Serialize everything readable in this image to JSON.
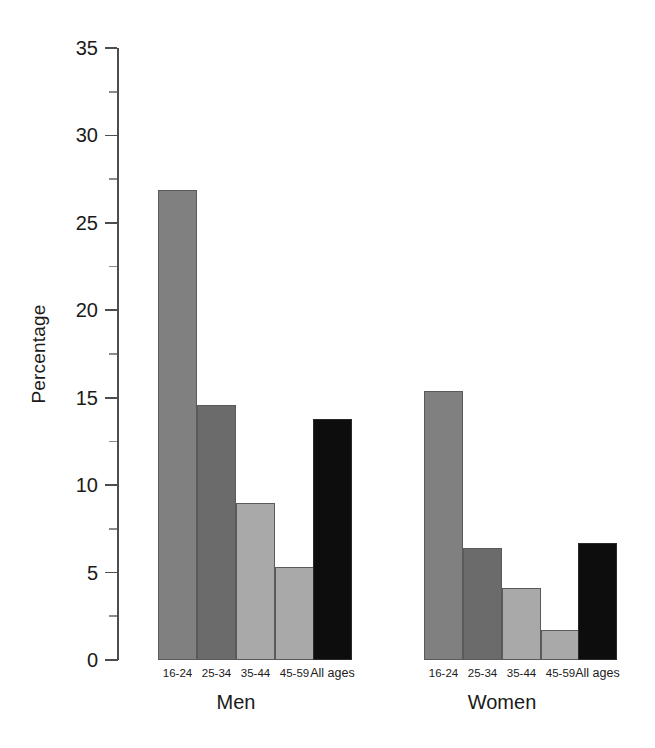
{
  "chart_data": {
    "type": "bar",
    "title": "",
    "subtitle": "",
    "xlabel": "",
    "ylabel": "Percentage",
    "ylim": [
      0,
      35
    ],
    "ytick_values": [
      0,
      5,
      10,
      15,
      20,
      25,
      30,
      35
    ],
    "ytick_labels": [
      "0",
      "5",
      "10",
      "15",
      "20",
      "25",
      "30",
      "35"
    ],
    "minor_ytick_values": [
      2.5,
      7.5,
      12.5,
      17.5,
      22.5,
      27.5,
      32.5
    ],
    "grid": false,
    "legend": "none",
    "categories": [
      "16-24",
      "25-34",
      "35-44",
      "45-59",
      "All ages"
    ],
    "groups": [
      {
        "name": "Men",
        "bars": [
          {
            "category": "16-24",
            "value": 26.9,
            "color": "#808080"
          },
          {
            "category": "25-34",
            "value": 14.6,
            "color": "#6b6b6b"
          },
          {
            "category": "35-44",
            "value": 9.0,
            "color": "#a9a9a9"
          },
          {
            "category": "45-59",
            "value": 5.3,
            "color": "#a9a9a9"
          },
          {
            "category": "All ages",
            "value": 13.8,
            "color": "#0d0d0d"
          }
        ]
      },
      {
        "name": "Women",
        "bars": [
          {
            "category": "16-24",
            "value": 15.4,
            "color": "#808080"
          },
          {
            "category": "25-34",
            "value": 6.4,
            "color": "#6b6b6b"
          },
          {
            "category": "35-44",
            "value": 4.1,
            "color": "#a9a9a9"
          },
          {
            "category": "45-59",
            "value": 1.7,
            "color": "#a9a9a9"
          },
          {
            "category": "All ages",
            "value": 6.7,
            "color": "#0d0d0d"
          }
        ]
      }
    ]
  },
  "axis": {
    "y_title": "Percentage"
  },
  "labels": {
    "men": "Men",
    "women": "Women",
    "all_ages": "All ages",
    "age_16_24": "16-24",
    "age_25_34": "25-34",
    "age_35_44": "35-44",
    "age_45_59": "45-59"
  },
  "colors": {
    "bar_light": "#a9a9a9",
    "bar_medium": "#808080",
    "bar_dark": "#6b6b6b",
    "bar_black": "#0d0d0d",
    "axis": "#4d4d4d",
    "text": "#1a1a1a",
    "background": "#ffffff"
  }
}
